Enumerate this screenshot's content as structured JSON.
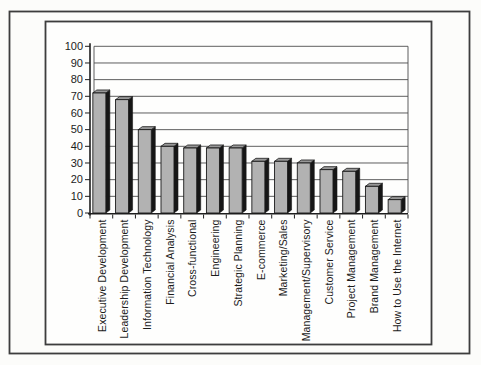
{
  "chart_data": {
    "type": "bar",
    "title": "",
    "xlabel": "",
    "ylabel": "",
    "categories": [
      "Executive Development",
      "Leadership Development",
      "Information Technology",
      "Financial Analysis",
      "Cross-functional",
      "Engineering",
      "Strategic Planning",
      "E-commerce",
      "Marketing/Sales",
      "Management/Supervisory",
      "Customer Service",
      "Project Management",
      "Brand Management",
      "How to Use the Internet"
    ],
    "values": [
      72,
      68,
      50,
      40,
      39,
      39,
      39,
      31,
      31,
      30,
      26,
      25,
      16,
      8
    ],
    "ylim": [
      0,
      100
    ],
    "yticks": [
      0,
      10,
      20,
      30,
      40,
      50,
      60,
      70,
      80,
      90,
      100
    ],
    "grid": true,
    "legend_position": "none",
    "bar_style": "3d-column-grayscale",
    "colors": {
      "bar_fill": "#b2b2b2",
      "bar_top": "#989898",
      "bar_side": "#161616",
      "bar_outline": "#1a1a1a",
      "gridline": "#4d4d4d",
      "axis": "#1f1f1f",
      "frame": "#3d3d3d",
      "plot_background": "#fefefd",
      "text": "#1c1c1c"
    }
  }
}
